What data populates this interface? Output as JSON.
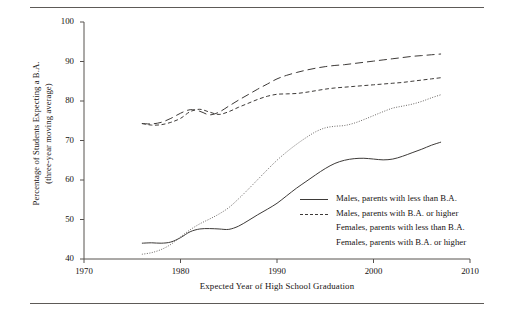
{
  "figure": {
    "rules": [
      "top-rule",
      "bottom-rule"
    ]
  },
  "chart_data": {
    "type": "line",
    "title": "",
    "xlabel": "Expected Year of High School Graduation",
    "ylabel_line1": "Percentage of Students Expecting a B.A.",
    "ylabel_line2": "(three-year moving average)",
    "xlim": [
      1970,
      2010
    ],
    "ylim": [
      40,
      100
    ],
    "xticks": [
      "1970",
      "1980",
      "1990",
      "2000",
      "2010"
    ],
    "yticks": [
      "100",
      "90",
      "80",
      "70",
      "60",
      "50",
      "40"
    ],
    "grid": false,
    "legend_position": "lower-right",
    "series": [
      {
        "name": "Males, parents with less than B.A.",
        "style": "solid",
        "color": "#3d3a38",
        "x": [
          1976,
          1977,
          1978,
          1979,
          1980,
          1981,
          1982,
          1983,
          1984,
          1985,
          1986,
          1987,
          1988,
          1989,
          1990,
          1991,
          1992,
          1993,
          1994,
          1995,
          1996,
          1997,
          1998,
          1999,
          2000,
          2001,
          2002,
          2003,
          2004,
          2005,
          2006,
          2007
        ],
        "y": [
          44.0,
          44.1,
          44.0,
          44.3,
          45.4,
          46.9,
          47.6,
          47.7,
          47.6,
          47.5,
          48.3,
          49.7,
          51.2,
          52.6,
          54.1,
          56.0,
          57.9,
          59.6,
          61.3,
          62.9,
          64.2,
          65.0,
          65.4,
          65.5,
          65.3,
          65.1,
          65.3,
          66.0,
          66.9,
          67.8,
          68.8,
          69.6
        ]
      },
      {
        "name": "Males, parents with B.A. or higher",
        "style": "dashed-short",
        "color": "#3d3a38",
        "x": [
          1976,
          1977,
          1978,
          1979,
          1980,
          1981,
          1982,
          1983,
          1984,
          1985,
          1986,
          1987,
          1988,
          1989,
          1990,
          1991,
          1992,
          1993,
          1994,
          1995,
          1996,
          1997,
          1998,
          1999,
          2000,
          2001,
          2002,
          2003,
          2004,
          2005,
          2006,
          2007
        ],
        "y": [
          74.3,
          73.9,
          74.0,
          74.6,
          75.6,
          77.3,
          77.9,
          77.2,
          76.6,
          77.3,
          78.4,
          79.4,
          80.4,
          81.2,
          81.7,
          81.8,
          81.9,
          82.2,
          82.6,
          83.0,
          83.3,
          83.5,
          83.7,
          83.9,
          84.1,
          84.3,
          84.5,
          84.7,
          85.0,
          85.3,
          85.6,
          85.9
        ]
      },
      {
        "name": "Females, parents with less than B.A.",
        "style": "dotted",
        "color": "#6b6765",
        "x": [
          1976,
          1977,
          1978,
          1979,
          1980,
          1981,
          1982,
          1983,
          1984,
          1985,
          1986,
          1987,
          1988,
          1989,
          1990,
          1991,
          1992,
          1993,
          1994,
          1995,
          1996,
          1997,
          1998,
          1999,
          2000,
          2001,
          2002,
          2003,
          2004,
          2005,
          2006,
          2007
        ],
        "y": [
          41.2,
          41.6,
          42.4,
          43.7,
          45.6,
          47.4,
          48.9,
          50.1,
          51.4,
          53.0,
          55.2,
          57.6,
          60.1,
          62.6,
          65.0,
          67.1,
          69.0,
          70.7,
          72.2,
          73.2,
          73.6,
          73.8,
          74.4,
          75.3,
          76.3,
          77.3,
          78.2,
          78.7,
          79.2,
          79.9,
          80.8,
          81.6
        ]
      },
      {
        "name": "Females, parents with B.A. or higher",
        "style": "dashed-long",
        "color": "#3d3a38",
        "x": [
          1976,
          1977,
          1978,
          1979,
          1980,
          1981,
          1982,
          1983,
          1984,
          1985,
          1986,
          1987,
          1988,
          1989,
          1990,
          1991,
          1992,
          1993,
          1994,
          1995,
          1996,
          1997,
          1998,
          1999,
          2000,
          2001,
          2002,
          2003,
          2004,
          2005,
          2006,
          2007
        ],
        "y": [
          74.3,
          74.2,
          74.6,
          75.6,
          76.9,
          77.8,
          77.4,
          76.5,
          77.2,
          78.7,
          80.2,
          81.6,
          83.0,
          84.3,
          85.6,
          86.5,
          87.2,
          87.8,
          88.3,
          88.7,
          89.0,
          89.2,
          89.5,
          89.8,
          90.1,
          90.4,
          90.7,
          91.0,
          91.3,
          91.5,
          91.7,
          91.9
        ]
      }
    ]
  },
  "legend": {
    "items": [
      {
        "label": "Males, parents with less than B.A.",
        "style": "solid"
      },
      {
        "label": "Males, parents with B.A. or higher",
        "style": "dashed-short"
      },
      {
        "label": "Females, parents with less than B.A.",
        "style": "dotted"
      },
      {
        "label": "Females, parents with B.A. or higher",
        "style": "dashed-long"
      }
    ]
  }
}
